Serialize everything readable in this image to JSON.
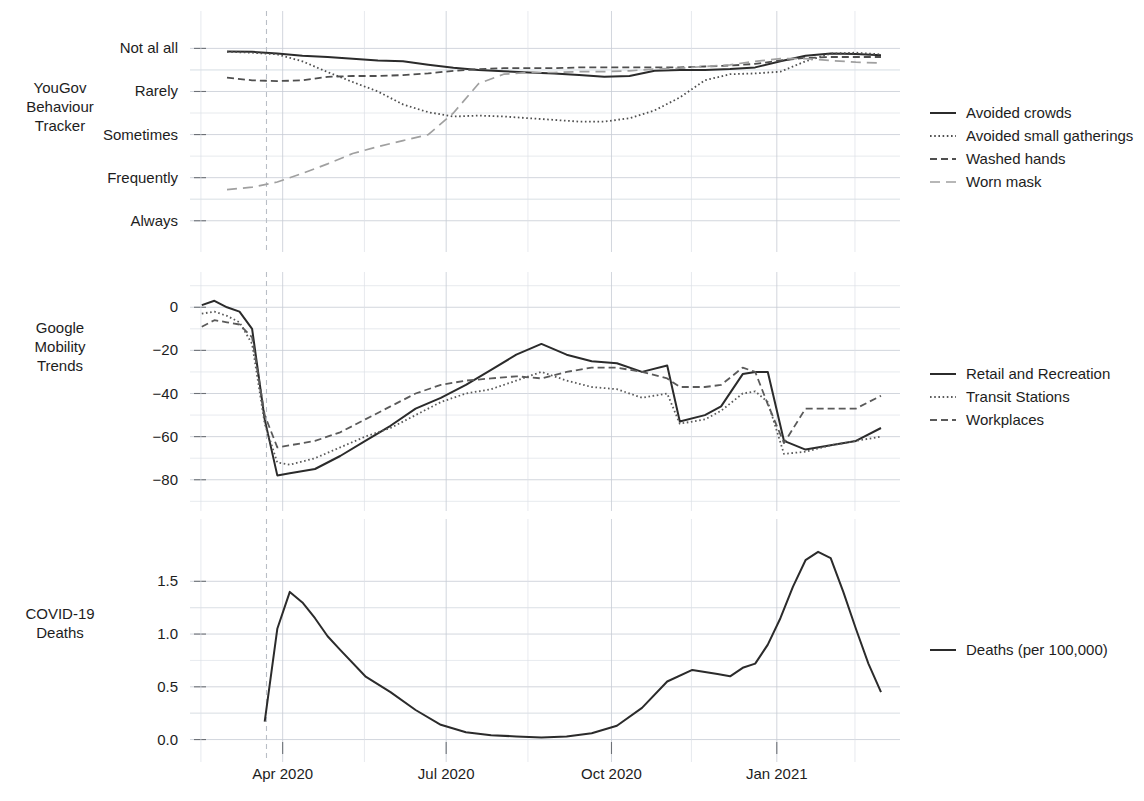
{
  "figure": {
    "width": 1144,
    "height": 801,
    "background": "#ffffff"
  },
  "axis": {
    "x_tick_labels": [
      "Apr 2020",
      "Jul 2020",
      "Oct 2020",
      "Jan 2021"
    ],
    "x_tick_dates": [
      "2020-04-01",
      "2020-07-01",
      "2020-10-01",
      "2021-01-01"
    ],
    "x_range": [
      "2020-02-15",
      "2021-03-05"
    ],
    "marker_line_date": "2020-03-23"
  },
  "colors": {
    "ink": "#1d1d1d",
    "series_dark": "#2b2b2b",
    "series_mid": "#5a5a5a",
    "series_light": "#9a9a9a",
    "grid_major": "#c7ccd4",
    "grid_minor": "#dde1e7"
  },
  "panels": [
    {
      "id": "yougov",
      "label": "YouGov\nBehaviour\nTracker",
      "label_lines": [
        "YouGov",
        "Behaviour",
        "Tracker"
      ],
      "y_tick_labels": [
        "Always",
        "Frequently",
        "Sometimes",
        "Rarely",
        "Not al all"
      ],
      "y_tick_values": [
        5,
        4,
        3,
        2,
        1
      ],
      "ylim": [
        0.6,
        5.45
      ],
      "legend": [
        {
          "label": "Avoided crowds",
          "style": "solid",
          "color": "#2b2b2b"
        },
        {
          "label": "Avoided small gatherings",
          "style": "dotted",
          "color": "#4f4f4f"
        },
        {
          "label": "Washed hands",
          "style": "dashed",
          "color": "#4f4f4f"
        },
        {
          "label": "Worn mask",
          "style": "longdash",
          "color": "#a0a0a0"
        }
      ]
    },
    {
      "id": "mobility",
      "label": "Google\nMobility\nTrends",
      "label_lines": [
        "Google",
        "Mobility",
        "Trends"
      ],
      "y_tick_labels": [
        "0",
        "−20",
        "−40",
        "−60",
        "−80"
      ],
      "y_tick_values": [
        0,
        -20,
        -40,
        -60,
        -80
      ],
      "ylim": [
        -88,
        8
      ],
      "legend": [
        {
          "label": "Retail and Recreation",
          "style": "solid",
          "color": "#2b2b2b"
        },
        {
          "label": "Transit Stations",
          "style": "dotted",
          "color": "#5a5a5a"
        },
        {
          "label": "Workplaces",
          "style": "dashed",
          "color": "#5a5a5a"
        }
      ]
    },
    {
      "id": "deaths",
      "label": "COVID-19\nDeaths",
      "label_lines": [
        "COVID-19",
        "Deaths"
      ],
      "y_tick_labels": [
        "0.0",
        "0.5",
        "1.0",
        "1.5"
      ],
      "y_tick_values": [
        0.0,
        0.5,
        1.0,
        1.5
      ],
      "ylim": [
        -0.08,
        1.92
      ],
      "legend": [
        {
          "label": "Deaths (per 100,000)",
          "style": "solid",
          "color": "#2b2b2b"
        }
      ]
    }
  ],
  "chart_data": {
    "type": "line",
    "title": "",
    "xlabel": "",
    "subplots": 3,
    "x_axis": {
      "type": "date",
      "range": [
        "2020-02-15",
        "2021-03-05"
      ],
      "ticks": [
        "2020-04-01",
        "2020-07-01",
        "2020-10-01",
        "2021-01-01"
      ],
      "tick_labels": [
        "Apr 2020",
        "Jul 2020",
        "Oct 2020",
        "Jan 2021"
      ],
      "grid": true
    },
    "panel_1": {
      "name": "YouGov Behaviour Tracker",
      "ylabel": "",
      "ylim": [
        0.6,
        5.45
      ],
      "ytick_labels": [
        "Not al all",
        "Rarely",
        "Sometimes",
        "Frequently",
        "Always"
      ],
      "ytick_values": [
        1,
        2,
        3,
        4,
        5
      ],
      "series": [
        {
          "name": "Avoided crowds",
          "style": "solid",
          "x": [
            "2020-03-01",
            "2020-03-15",
            "2020-03-29",
            "2020-04-12",
            "2020-04-26",
            "2020-05-10",
            "2020-05-24",
            "2020-06-07",
            "2020-06-21",
            "2020-07-05",
            "2020-07-19",
            "2020-08-02",
            "2020-08-16",
            "2020-08-30",
            "2020-09-13",
            "2020-09-27",
            "2020-10-11",
            "2020-10-25",
            "2020-11-08",
            "2020-11-22",
            "2020-12-06",
            "2020-12-20",
            "2021-01-03",
            "2021-01-17",
            "2021-01-31",
            "2021-02-14",
            "2021-02-28"
          ],
          "y": [
            4.93,
            4.92,
            4.88,
            4.83,
            4.8,
            4.76,
            4.72,
            4.7,
            4.62,
            4.55,
            4.5,
            4.47,
            4.44,
            4.42,
            4.38,
            4.34,
            4.36,
            4.48,
            4.5,
            4.5,
            4.52,
            4.56,
            4.7,
            4.83,
            4.88,
            4.87,
            4.84
          ]
        },
        {
          "name": "Avoided small gatherings",
          "style": "dotted",
          "x": [
            "2020-03-01",
            "2020-03-15",
            "2020-03-29",
            "2020-04-12",
            "2020-04-26",
            "2020-05-10",
            "2020-05-24",
            "2020-06-07",
            "2020-06-21",
            "2020-07-05",
            "2020-07-19",
            "2020-08-02",
            "2020-08-16",
            "2020-08-30",
            "2020-09-13",
            "2020-09-27",
            "2020-10-11",
            "2020-10-25",
            "2020-11-08",
            "2020-11-22",
            "2020-12-06",
            "2020-12-20",
            "2021-01-03",
            "2021-01-17",
            "2021-01-31",
            "2021-02-14",
            "2021-02-28"
          ],
          "y": [
            4.92,
            4.9,
            4.86,
            4.7,
            4.45,
            4.22,
            4.0,
            3.7,
            3.52,
            3.42,
            3.44,
            3.42,
            3.38,
            3.34,
            3.3,
            3.3,
            3.38,
            3.56,
            3.86,
            4.26,
            4.4,
            4.42,
            4.46,
            4.7,
            4.88,
            4.9,
            4.86
          ]
        },
        {
          "name": "Washed hands",
          "style": "dashed",
          "x": [
            "2020-03-01",
            "2020-03-15",
            "2020-03-29",
            "2020-04-12",
            "2020-04-26",
            "2020-05-10",
            "2020-05-24",
            "2020-06-07",
            "2020-06-21",
            "2020-07-05",
            "2020-07-19",
            "2020-08-02",
            "2020-08-16",
            "2020-08-30",
            "2020-09-13",
            "2020-09-27",
            "2020-10-11",
            "2020-10-25",
            "2020-11-08",
            "2020-11-22",
            "2020-12-06",
            "2020-12-20",
            "2021-01-03",
            "2021-01-17",
            "2021-01-31",
            "2021-02-14",
            "2021-02-28"
          ],
          "y": [
            4.32,
            4.26,
            4.24,
            4.26,
            4.34,
            4.36,
            4.36,
            4.38,
            4.42,
            4.48,
            4.52,
            4.54,
            4.54,
            4.54,
            4.56,
            4.56,
            4.56,
            4.56,
            4.56,
            4.58,
            4.6,
            4.64,
            4.72,
            4.78,
            4.8,
            4.8,
            4.8
          ]
        },
        {
          "name": "Worn mask",
          "style": "longdash",
          "x": [
            "2020-03-01",
            "2020-03-15",
            "2020-03-29",
            "2020-04-12",
            "2020-04-26",
            "2020-05-10",
            "2020-05-24",
            "2020-06-07",
            "2020-06-21",
            "2020-07-05",
            "2020-07-19",
            "2020-08-02",
            "2020-08-16",
            "2020-08-30",
            "2020-09-13",
            "2020-09-27",
            "2020-10-11",
            "2020-10-25",
            "2020-11-08",
            "2020-11-22",
            "2020-12-06",
            "2020-12-20",
            "2021-01-03",
            "2021-01-17",
            "2021-01-31",
            "2021-02-14",
            "2021-02-28"
          ],
          "y": [
            1.72,
            1.78,
            1.9,
            2.1,
            2.32,
            2.56,
            2.72,
            2.86,
            3.0,
            3.5,
            4.18,
            4.4,
            4.44,
            4.44,
            4.46,
            4.46,
            4.48,
            4.52,
            4.54,
            4.58,
            4.62,
            4.7,
            4.76,
            4.76,
            4.72,
            4.68,
            4.66
          ]
        }
      ]
    },
    "panel_2": {
      "name": "Google Mobility Trends",
      "ylabel": "",
      "ylim": [
        -88,
        8
      ],
      "ytick_values": [
        0,
        -20,
        -40,
        -60,
        -80
      ],
      "ytick_labels": [
        "0",
        "-20",
        "-40",
        "-60",
        "-80"
      ],
      "series": [
        {
          "name": "Retail and Recreation",
          "style": "solid",
          "x": [
            "2020-02-16",
            "2020-02-23",
            "2020-03-01",
            "2020-03-08",
            "2020-03-15",
            "2020-03-22",
            "2020-03-29",
            "2020-04-05",
            "2020-04-19",
            "2020-05-03",
            "2020-05-17",
            "2020-05-31",
            "2020-06-14",
            "2020-06-28",
            "2020-07-12",
            "2020-07-26",
            "2020-08-09",
            "2020-08-23",
            "2020-09-06",
            "2020-09-20",
            "2020-10-04",
            "2020-10-18",
            "2020-11-01",
            "2020-11-08",
            "2020-11-22",
            "2020-12-01",
            "2020-12-13",
            "2020-12-20",
            "2020-12-27",
            "2021-01-05",
            "2021-01-17",
            "2021-01-31",
            "2021-02-14",
            "2021-02-28"
          ],
          "y": [
            1,
            3,
            0,
            -2,
            -10,
            -52,
            -78,
            -77,
            -75,
            -69,
            -62,
            -55,
            -47,
            -42,
            -36,
            -29,
            -22,
            -17,
            -22,
            -25,
            -26,
            -30,
            -27,
            -53,
            -50,
            -46,
            -31,
            -30,
            -30,
            -62,
            -66,
            -64,
            -62,
            -56
          ]
        },
        {
          "name": "Transit Stations",
          "style": "dotted",
          "x": [
            "2020-02-16",
            "2020-02-23",
            "2020-03-01",
            "2020-03-08",
            "2020-03-15",
            "2020-03-22",
            "2020-03-29",
            "2020-04-05",
            "2020-04-19",
            "2020-05-03",
            "2020-05-17",
            "2020-05-31",
            "2020-06-14",
            "2020-06-28",
            "2020-07-12",
            "2020-07-26",
            "2020-08-09",
            "2020-08-23",
            "2020-09-06",
            "2020-09-20",
            "2020-10-04",
            "2020-10-18",
            "2020-11-01",
            "2020-11-08",
            "2020-11-22",
            "2020-12-01",
            "2020-12-13",
            "2020-12-20",
            "2020-12-27",
            "2021-01-05",
            "2021-01-17",
            "2021-01-31",
            "2021-02-14",
            "2021-02-28"
          ],
          "y": [
            -3,
            -2,
            -4,
            -7,
            -17,
            -54,
            -72,
            -73,
            -70,
            -65,
            -60,
            -56,
            -50,
            -44,
            -40,
            -38,
            -34,
            -30,
            -34,
            -37,
            -38,
            -42,
            -40,
            -54,
            -52,
            -48,
            -40,
            -39,
            -44,
            -68,
            -67,
            -64,
            -62,
            -60
          ]
        },
        {
          "name": "Workplaces",
          "style": "dashed",
          "x": [
            "2020-02-16",
            "2020-02-23",
            "2020-03-01",
            "2020-03-08",
            "2020-03-15",
            "2020-03-22",
            "2020-03-29",
            "2020-04-05",
            "2020-04-19",
            "2020-05-03",
            "2020-05-17",
            "2020-05-31",
            "2020-06-14",
            "2020-06-28",
            "2020-07-12",
            "2020-07-26",
            "2020-08-09",
            "2020-08-23",
            "2020-09-06",
            "2020-09-20",
            "2020-10-04",
            "2020-10-18",
            "2020-11-01",
            "2020-11-08",
            "2020-11-22",
            "2020-12-01",
            "2020-12-13",
            "2020-12-20",
            "2020-12-27",
            "2021-01-05",
            "2021-01-17",
            "2021-01-31",
            "2021-02-14",
            "2021-02-28"
          ],
          "y": [
            -9,
            -6,
            -7,
            -8,
            -14,
            -50,
            -65,
            -64,
            -62,
            -58,
            -52,
            -46,
            -40,
            -36,
            -34,
            -33,
            -32,
            -33,
            -30,
            -28,
            -28,
            -30,
            -33,
            -37,
            -37,
            -36,
            -28,
            -30,
            -45,
            -63,
            -47,
            -47,
            -47,
            -41
          ]
        }
      ]
    },
    "panel_3": {
      "name": "COVID-19 Deaths",
      "ylabel": "",
      "ylim": [
        -0.08,
        1.92
      ],
      "ytick_values": [
        0.0,
        0.5,
        1.0,
        1.5
      ],
      "ytick_labels": [
        "0.0",
        "0.5",
        "1.0",
        "1.5"
      ],
      "series": [
        {
          "name": "Deaths (per 100,000)",
          "style": "solid",
          "x": [
            "2020-03-22",
            "2020-03-29",
            "2020-04-05",
            "2020-04-12",
            "2020-04-19",
            "2020-04-26",
            "2020-05-03",
            "2020-05-17",
            "2020-05-31",
            "2020-06-14",
            "2020-06-28",
            "2020-07-12",
            "2020-07-26",
            "2020-08-09",
            "2020-08-23",
            "2020-09-06",
            "2020-09-20",
            "2020-10-04",
            "2020-10-18",
            "2020-11-01",
            "2020-11-15",
            "2020-11-29",
            "2020-12-06",
            "2020-12-13",
            "2020-12-20",
            "2020-12-27",
            "2021-01-03",
            "2021-01-10",
            "2021-01-17",
            "2021-01-24",
            "2021-01-31",
            "2021-02-07",
            "2021-02-14",
            "2021-02-21",
            "2021-02-28"
          ],
          "y": [
            0.17,
            1.05,
            1.4,
            1.3,
            1.15,
            0.98,
            0.85,
            0.6,
            0.45,
            0.28,
            0.14,
            0.07,
            0.04,
            0.03,
            0.02,
            0.03,
            0.06,
            0.13,
            0.3,
            0.55,
            0.66,
            0.62,
            0.6,
            0.68,
            0.72,
            0.9,
            1.15,
            1.45,
            1.7,
            1.78,
            1.72,
            1.4,
            1.05,
            0.72,
            0.45
          ]
        }
      ]
    }
  }
}
